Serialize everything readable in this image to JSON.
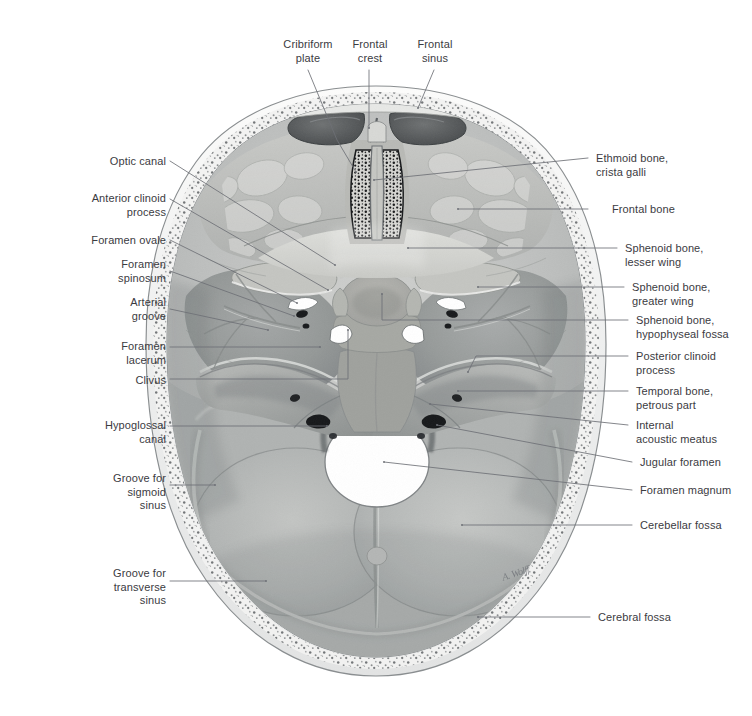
{
  "figure": {
    "background_color": "#ffffff",
    "label_color": "#3b3b3f",
    "leader_color": "#6e7076",
    "artist_signature": "A. Wolff"
  },
  "labels": {
    "top": [
      {
        "id": "cribriform-plate",
        "text": "Cribriform\nplate",
        "x": 270,
        "y": 38,
        "align": "center",
        "w": 76
      },
      {
        "id": "frontal-crest",
        "text": "Frontal\ncrest",
        "x": 343,
        "y": 38,
        "align": "center",
        "w": 54
      },
      {
        "id": "frontal-sinus",
        "text": "Frontal\nsinus",
        "x": 408,
        "y": 38,
        "align": "center",
        "w": 54
      }
    ],
    "left": [
      {
        "id": "optic-canal",
        "text": "Optic canal",
        "x": 78,
        "y": 155,
        "align": "right",
        "w": 88
      },
      {
        "id": "anterior-clinoid-process",
        "text": "Anterior clinoid\nprocess",
        "x": 28,
        "y": 192,
        "align": "right",
        "w": 138
      },
      {
        "id": "foramen-ovale",
        "text": "Foramen ovale",
        "x": 48,
        "y": 234,
        "align": "right",
        "w": 118
      },
      {
        "id": "foramen-spinosum",
        "text": "Foramen\nspinosum",
        "x": 62,
        "y": 258,
        "align": "right",
        "w": 104
      },
      {
        "id": "arterial-groove",
        "text": "Arterial\ngroove",
        "x": 78,
        "y": 296,
        "align": "right",
        "w": 88
      },
      {
        "id": "foramen-lacerum",
        "text": "Foramen\nlacerum",
        "x": 62,
        "y": 340,
        "align": "right",
        "w": 104
      },
      {
        "id": "clivus",
        "text": "Clivus",
        "x": 111,
        "y": 374,
        "align": "right",
        "w": 55
      },
      {
        "id": "hypoglossal-canal",
        "text": "Hypoglossal\ncanal",
        "x": 40,
        "y": 419,
        "align": "right",
        "w": 126
      },
      {
        "id": "groove-sigmoid-sinus",
        "text": "Groove for\nsigmoid\nsinus",
        "x": 62,
        "y": 472,
        "align": "right",
        "w": 104
      },
      {
        "id": "groove-transverse-sinus",
        "text": "Groove for\ntransverse\nsinus",
        "x": 55,
        "y": 567,
        "align": "right",
        "w": 111
      }
    ],
    "right": [
      {
        "id": "ethmoid-bone-crista-galli",
        "text": "Ethmoid bone,\ncrista galli",
        "x": 596,
        "y": 152,
        "align": "left",
        "w": 150
      },
      {
        "id": "frontal-bone",
        "text": "Frontal bone",
        "x": 612,
        "y": 203,
        "align": "left",
        "w": 134
      },
      {
        "id": "sphenoid-bone-lesser-wing",
        "text": "Sphenoid bone,\nlesser wing",
        "x": 625,
        "y": 242,
        "align": "left",
        "w": 127
      },
      {
        "id": "sphenoid-bone-greater-wing",
        "text": "Sphenoid bone,\ngreater wing",
        "x": 632,
        "y": 281,
        "align": "left",
        "w": 120
      },
      {
        "id": "sphenoid-bone-hypophyseal-fossa",
        "text": "Sphenoid bone,\nhypophyseal fossa",
        "x": 636,
        "y": 314,
        "align": "left",
        "w": 116
      },
      {
        "id": "posterior-clinoid-process",
        "text": "Posterior clinoid\nprocess",
        "x": 636,
        "y": 350,
        "align": "left",
        "w": 116
      },
      {
        "id": "temporal-bone-petrous-part",
        "text": "Temporal bone,\npetrous part",
        "x": 636,
        "y": 385,
        "align": "left",
        "w": 116
      },
      {
        "id": "internal-acoustic-meatus",
        "text": "Internal\nacoustic meatus",
        "x": 636,
        "y": 419,
        "align": "left",
        "w": 116
      },
      {
        "id": "jugular-foramen",
        "text": "Jugular foramen",
        "x": 640,
        "y": 456,
        "align": "left",
        "w": 112
      },
      {
        "id": "foramen-magnum",
        "text": "Foramen magnum",
        "x": 640,
        "y": 484,
        "align": "left",
        "w": 112
      },
      {
        "id": "cerebellar-fossa",
        "text": "Cerebellar fossa",
        "x": 640,
        "y": 519,
        "align": "left",
        "w": 112
      },
      {
        "id": "cerebral-fossa",
        "text": "Cerebral fossa",
        "x": 598,
        "y": 611,
        "align": "left",
        "w": 150
      }
    ]
  },
  "leaders": [
    {
      "id": "leader-cribriform-plate",
      "points": "308,70 337,140 356,172"
    },
    {
      "id": "leader-frontal-crest",
      "points": "369,70 369,128"
    },
    {
      "id": "leader-frontal-sinus",
      "points": "434,70 418,108"
    },
    {
      "id": "leader-optic-canal",
      "points": "170,161 335,265"
    },
    {
      "id": "leader-anterior-clinoid-process",
      "points": "170,199 328,290"
    },
    {
      "id": "leader-foramen-ovale",
      "points": "170,240 297,303"
    },
    {
      "id": "leader-foramen-spinosum",
      "points": "170,271 294,316"
    },
    {
      "id": "leader-arterial-groove",
      "points": "170,309 268,330"
    },
    {
      "id": "leader-foramen-lacerum",
      "points": "170,347 320,347"
    },
    {
      "id": "leader-clivus",
      "points": "170,379 348,379 348,330"
    },
    {
      "id": "leader-hypoglossal-canal",
      "points": "170,426 327,426"
    },
    {
      "id": "leader-groove-sigmoid-sinus",
      "points": "170,485 215,485"
    },
    {
      "id": "leader-groove-transverse-sinus",
      "points": "170,581 266,581"
    },
    {
      "id": "leader-ethmoid-bone-crista-galli",
      "points": "588,158 374,180"
    },
    {
      "id": "leader-frontal-bone",
      "points": "588,209 458,209"
    },
    {
      "id": "leader-sphenoid-bone-lesser-wing",
      "points": "617,248 408,248"
    },
    {
      "id": "leader-sphenoid-bone-greater-wing",
      "points": "624,287 478,287"
    },
    {
      "id": "leader-sphenoid-bone-hypophyseal-fossa",
      "points": "628,320 382,320 382,294"
    },
    {
      "id": "leader-posterior-clinoid-process",
      "points": "628,356 476,356 468,372"
    },
    {
      "id": "leader-temporal-bone-petrous-part",
      "points": "628,391 458,391"
    },
    {
      "id": "leader-internal-acoustic-meatus",
      "points": "628,425 430,404"
    },
    {
      "id": "leader-jugular-foramen",
      "points": "632,462 437,425"
    },
    {
      "id": "leader-foramen-magnum",
      "points": "632,490 384,462"
    },
    {
      "id": "leader-cerebellar-fossa",
      "points": "632,525 462,525"
    },
    {
      "id": "leader-cerebral-fossa",
      "points": "590,617 478,617"
    }
  ]
}
